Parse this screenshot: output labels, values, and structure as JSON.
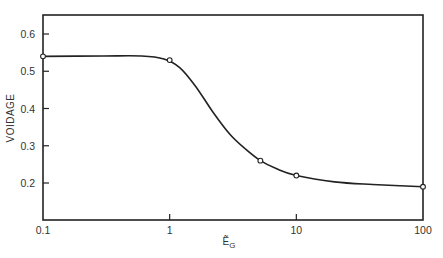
{
  "chart_data": {
    "type": "line",
    "title": "",
    "xlabel": "Ẽ",
    "xlabel_subscript": "G",
    "ylabel": "VOIDAGE",
    "xscale": "log",
    "xlim": [
      0.1,
      100
    ],
    "ylim": [
      0.12,
      0.65
    ],
    "xticks": [
      0.1,
      1,
      10,
      100
    ],
    "xtick_labels": [
      "0.1",
      "1",
      "10",
      "100"
    ],
    "yticks": [
      0.2,
      0.3,
      0.4,
      0.5,
      0.6
    ],
    "ytick_labels": [
      "0.2",
      "0.3",
      "0.4",
      "0.5",
      "0.6"
    ],
    "grid": false,
    "legend": "none",
    "series": [
      {
        "name": "voidage",
        "markers": {
          "x": [
            0.1,
            1,
            5.2,
            10,
            100
          ],
          "y": [
            0.54,
            0.53,
            0.26,
            0.22,
            0.19
          ]
        },
        "curve": {
          "x": [
            0.1,
            0.3,
            0.6,
            0.9,
            1.2,
            1.6,
            2.2,
            3,
            4,
            5.2,
            7,
            10,
            20,
            40,
            100
          ],
          "y": [
            0.54,
            0.541,
            0.541,
            0.533,
            0.51,
            0.46,
            0.39,
            0.33,
            0.29,
            0.26,
            0.238,
            0.22,
            0.203,
            0.196,
            0.19
          ]
        }
      }
    ]
  }
}
